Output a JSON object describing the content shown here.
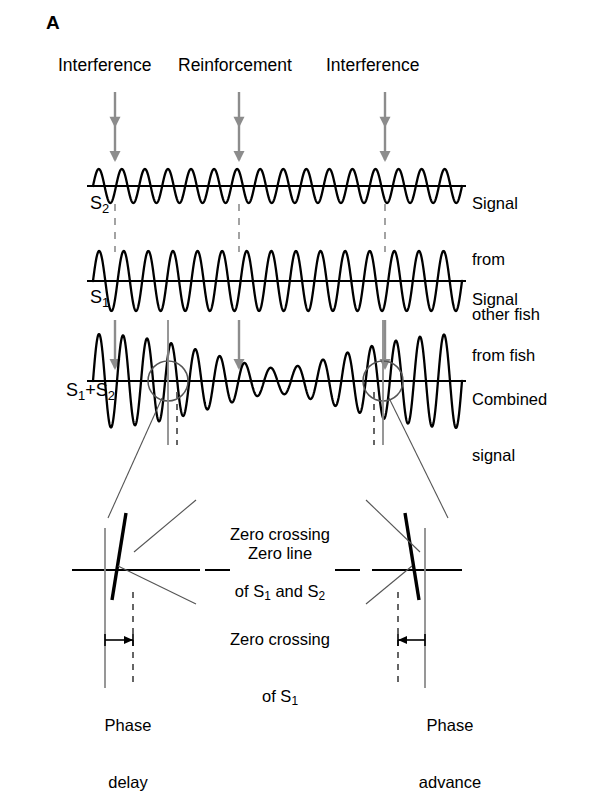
{
  "figure": {
    "panel_letter": "A",
    "background_color": "#ffffff",
    "ink_color": "#000000",
    "marker_color": "#808080"
  },
  "event_labels": [
    {
      "text": "Interference",
      "arrow_x": 115
    },
    {
      "text": "Reinforcement",
      "arrow_x": 239
    },
    {
      "text": "Interference",
      "arrow_x": 385
    }
  ],
  "traces": [
    {
      "name": "S",
      "name_sub": "2",
      "side_label_lines": [
        "Signal",
        "from",
        "other fish"
      ],
      "cycles": 16,
      "amplitude": 17,
      "baseline_y": 186,
      "phase": 0.0
    },
    {
      "name": "S",
      "name_sub": "1",
      "side_label_lines": [
        "Signal",
        "from fish"
      ],
      "cycles": 15,
      "amplitude": 30,
      "baseline_y": 281,
      "phase": 0.0
    },
    {
      "name": "S",
      "name_sub": "1",
      "name_extra": "+S",
      "name_sub2": "2",
      "side_label_lines": [
        "Combined",
        "signal"
      ],
      "cycles": 15,
      "amplitude": 47,
      "baseline_y": 381,
      "phase": 0.0
    }
  ],
  "detail_panel": {
    "zero_crossing_both": "Zero crossing\nof S₁ and S₂",
    "zero_crossing_both_line1": "Zero crossing",
    "zero_crossing_both_line2_pre": "of S",
    "zero_crossing_both_line2_sub1": "1",
    "zero_crossing_both_line2_mid": " and S",
    "zero_crossing_both_line2_sub2": "2",
    "zero_line": "Zero line",
    "zero_crossing_s1_line1": "Zero crossing",
    "zero_crossing_s1_line2_pre": "of S",
    "zero_crossing_s1_line2_sub": "1",
    "phase_delay_line1": "Phase",
    "phase_delay_line2": "delay",
    "phase_advance_line1": "Phase",
    "phase_advance_line2": "advance"
  },
  "chart_data": {
    "type": "line",
    "xlabel": "",
    "ylabel": "",
    "x_range": [
      0,
      1
    ],
    "grid": false,
    "legend_position": "right",
    "series": [
      {
        "name": "S2 - Signal from other fish",
        "cycles": 16,
        "amplitude": 17,
        "phase_deg": 0
      },
      {
        "name": "S1 - Signal from fish",
        "cycles": 15,
        "amplitude": 30,
        "phase_deg": 0
      },
      {
        "name": "S1+S2 - Combined signal",
        "cycles": 15,
        "amplitude": 47,
        "phase_deg": 0,
        "is_sum": true,
        "beat_minima_x": [
          0.13,
          0.79
        ],
        "beat_maximum_x": [
          0.46
        ]
      }
    ],
    "annotations": [
      {
        "label": "Interference",
        "x_fraction": 0.13,
        "type": "arrow-down"
      },
      {
        "label": "Reinforcement",
        "x_fraction": 0.46,
        "type": "arrow-down"
      },
      {
        "label": "Interference",
        "x_fraction": 0.79,
        "type": "arrow-down"
      },
      {
        "label": "Zero crossing of S1 and S2",
        "type": "callout"
      },
      {
        "label": "Zero line",
        "type": "callout"
      },
      {
        "label": "Zero crossing of S1",
        "type": "callout"
      },
      {
        "label": "Phase delay",
        "type": "measure",
        "x_fraction": 0.13
      },
      {
        "label": "Phase advance",
        "type": "measure",
        "x_fraction": 0.79
      }
    ]
  }
}
